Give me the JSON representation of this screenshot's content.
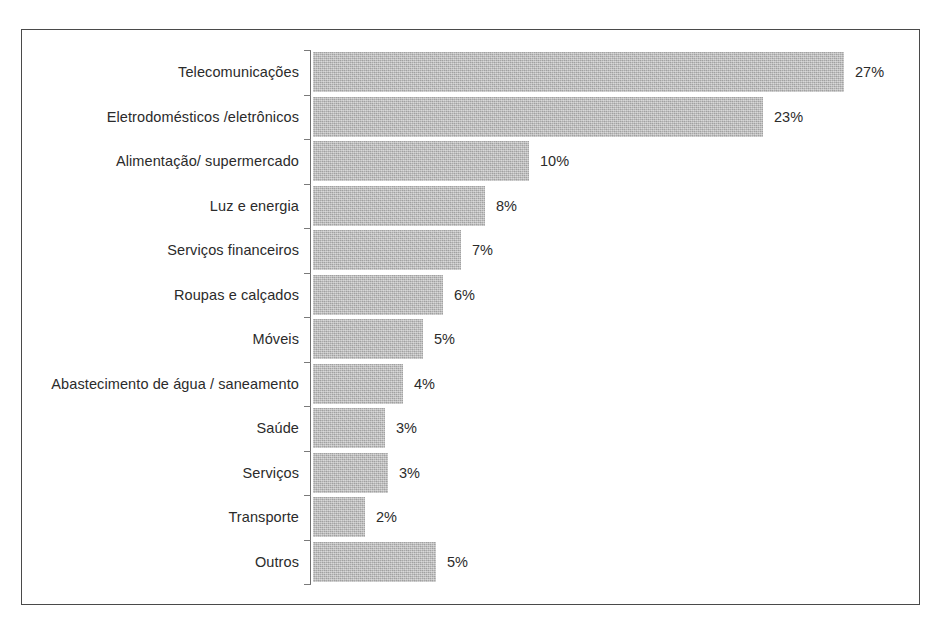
{
  "title_remnant": "",
  "chart_data": {
    "type": "bar",
    "orientation": "horizontal",
    "title": "",
    "subtitle": "",
    "xlabel": "",
    "ylabel": "",
    "grid": false,
    "legend": false,
    "value_suffix": "%",
    "xlim": [
      0,
      28
    ],
    "categories": [
      "Telecomunicações",
      "Eletrodomésticos /eletrônicos",
      "Alimentação/ supermercado",
      "Luz e energia",
      "Serviços financeiros",
      "Roupas e calçados",
      "Móveis",
      "Abastecimento de água / saneamento",
      "Saúde",
      "Serviços",
      "Transporte",
      "Outros"
    ],
    "values": [
      27,
      23,
      10,
      8,
      7,
      6,
      5,
      4,
      3,
      3,
      2,
      5
    ],
    "value_labels": [
      "27%",
      "23%",
      "10%",
      "8%",
      "7%",
      "6%",
      "5%",
      "4%",
      "3%",
      "3%",
      "2%",
      "5%"
    ],
    "bar_pixel_lengths": [
      531,
      450,
      216,
      172,
      148,
      130,
      110,
      90,
      72,
      75,
      52,
      123
    ],
    "colors": {
      "bar_fill": "#b6b6b6",
      "frame": "#4a4a4a",
      "axis": "#6e6e6e",
      "text": "#2b2b2b",
      "background": "#ffffff"
    }
  }
}
